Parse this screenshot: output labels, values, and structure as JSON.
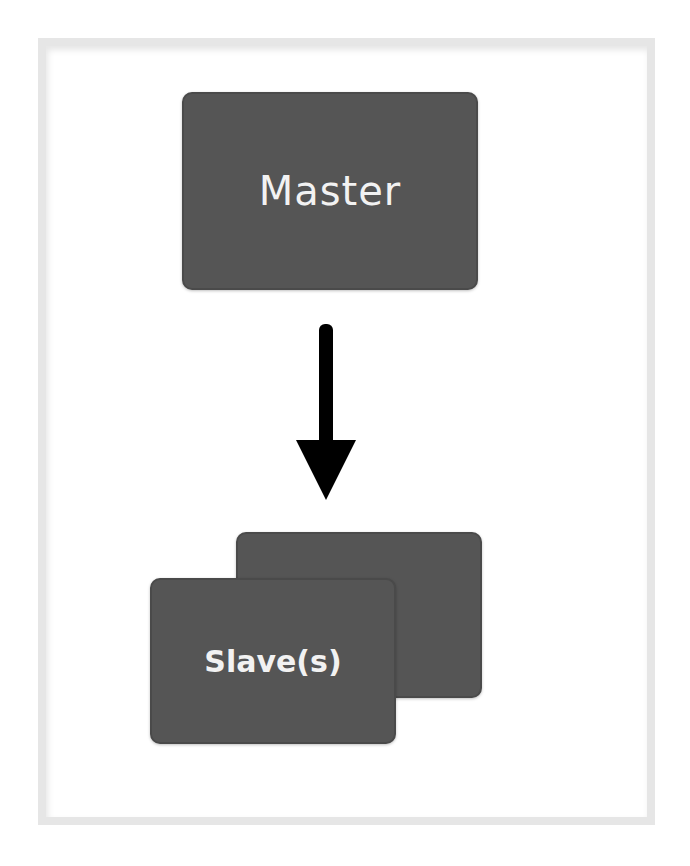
{
  "diagram": {
    "type": "master-slave-replication",
    "nodes": [
      {
        "id": "master",
        "label": "Master"
      },
      {
        "id": "slaves",
        "label": "Slave(s)",
        "stacked": true
      }
    ],
    "edges": [
      {
        "from": "master",
        "to": "slaves",
        "direction": "down"
      }
    ]
  },
  "colors": {
    "box_fill": "#555555",
    "box_text": "#f2f2f2",
    "arrow": "#000000",
    "frame": "#e6e6e6"
  }
}
